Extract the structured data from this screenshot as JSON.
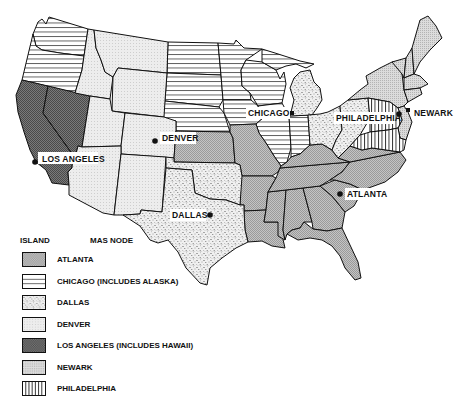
{
  "map": {
    "type": "regional-assignment-map",
    "area": "United States (contiguous)",
    "colors": {
      "outline": "#111111",
      "background": "#ffffff",
      "atlanta": "#b8b8b8",
      "los_angeles": "#6a6a6a",
      "denver": "#e6e6e6",
      "newark": "#d2d2d2",
      "dallas_dots": "#555555",
      "chicago_lines": "#333333",
      "philadelphia_lines": "#222222"
    },
    "cities": [
      {
        "id": "los-angeles",
        "label": "LOS ANGELES",
        "region": "Los Angeles"
      },
      {
        "id": "denver",
        "label": "DENVER",
        "region": "Denver"
      },
      {
        "id": "chicago",
        "label": "CHICAGO",
        "region": "Chicago"
      },
      {
        "id": "philadelphia",
        "label": "PHILADELPHIA",
        "region": "Philadelphia"
      },
      {
        "id": "newark",
        "label": "NEWARK",
        "region": "Newark"
      },
      {
        "id": "dallas",
        "label": "DALLAS",
        "region": "Dallas"
      },
      {
        "id": "atlanta",
        "label": "ATLANTA",
        "region": "Atlanta"
      }
    ],
    "regions": {
      "Chicago": [
        "WA",
        "OR",
        "ND",
        "SD",
        "NE",
        "MN",
        "WI",
        "IA",
        "IL",
        "MI (upper)",
        "IN"
      ],
      "Los Angeles": [
        "CA",
        "NV"
      ],
      "Denver": [
        "ID",
        "MT",
        "WY",
        "UT",
        "CO",
        "AZ",
        "NM"
      ],
      "Dallas": [
        "TX",
        "OK",
        "MI (lower)",
        "OH",
        "PA (west)"
      ],
      "Atlanta": [
        "KS",
        "MO",
        "AR",
        "LA",
        "MS",
        "AL",
        "GA",
        "FL",
        "TN",
        "KY",
        "SC",
        "NC",
        "VA (west)"
      ],
      "Newark": [
        "NY",
        "VT",
        "NH",
        "ME",
        "MA",
        "CT",
        "RI",
        "NJ"
      ],
      "Philadelphia": [
        "PA (east)",
        "MD",
        "DE",
        "VA (east)",
        "WV (east)"
      ]
    }
  },
  "legend": {
    "header_left": "ISLAND",
    "header_right": "MAS NODE",
    "items": [
      {
        "label": "ATLANTA",
        "pattern": "crosshatch-light"
      },
      {
        "label": "CHICAGO (INCLUDES ALASKA)",
        "pattern": "horizontal-lines"
      },
      {
        "label": "DALLAS",
        "pattern": "speckle"
      },
      {
        "label": "DENVER",
        "pattern": "fine-dots"
      },
      {
        "label": "LOS ANGELES (INCLUDES HAWAII)",
        "pattern": "crosshatch-dark"
      },
      {
        "label": "NEWARK",
        "pattern": "stipple"
      },
      {
        "label": "PHILADELPHIA",
        "pattern": "vertical-lines"
      }
    ]
  }
}
